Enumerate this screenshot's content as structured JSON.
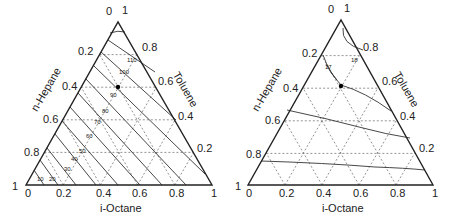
{
  "diagrams": [
    {
      "id": "left",
      "type": "ternary-contour",
      "axes": {
        "left": {
          "title": "n-Hepane",
          "ticks": [
            "1",
            "0.8",
            "0.6",
            "0.4",
            "0.2",
            "0"
          ]
        },
        "right": {
          "title": "Toluene",
          "ticks": [
            "0.2",
            "0.4",
            "0.6",
            "0.8",
            "1"
          ]
        },
        "bottom": {
          "title": "i-Octane",
          "ticks": [
            "0",
            "0.2",
            "0.4",
            "0.6",
            "0.8",
            "1"
          ]
        }
      },
      "contour_labels": [
        "10",
        "20",
        "30",
        "40",
        "50",
        "60",
        "70",
        "80",
        "90",
        "100",
        "110"
      ],
      "marked_point": {
        "n_heptane": 0.4,
        "toluene": 0.6,
        "i_octane": 0.0
      }
    },
    {
      "id": "right",
      "type": "ternary-contour",
      "axes": {
        "left": {
          "title": "n-Hepane",
          "ticks": [
            "1",
            "0.8",
            "0.6",
            "0.4",
            "0.2",
            "0"
          ]
        },
        "right": {
          "title": "Toluene",
          "ticks": [
            "0.2",
            "0.4",
            "0.6",
            "0.8",
            "1"
          ]
        },
        "bottom": {
          "title": "i-Octane",
          "ticks": [
            "0",
            "0.2",
            "0.4",
            "0.6",
            "0.8",
            "1"
          ]
        }
      },
      "contour_labels": [
        "17",
        "18"
      ],
      "marked_point": {
        "n_heptane": 0.4,
        "toluene": 0.6,
        "i_octane": 0.0
      }
    }
  ],
  "colors": {
    "axis": "#222222",
    "grid": "#555555",
    "contour": "#333333",
    "point": "#000000"
  }
}
